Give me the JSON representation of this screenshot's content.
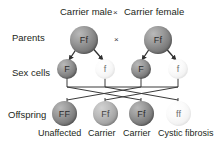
{
  "diagram": {
    "title_left": "Carrier male",
    "title_cross": "×",
    "title_right": "Carrier female",
    "parents_cross": "×",
    "rows": {
      "parents_label": "Parents",
      "sex_cells_label": "Sex cells",
      "offspring_label": "Offspring"
    },
    "parents": [
      {
        "genotype": "Ff",
        "shade": "dark"
      },
      {
        "genotype": "Ff",
        "shade": "dark"
      }
    ],
    "sex_cells": [
      {
        "allele": "F",
        "shade": "dark"
      },
      {
        "allele": "f",
        "shade": "light"
      },
      {
        "allele": "F",
        "shade": "dark"
      },
      {
        "allele": "f",
        "shade": "light"
      }
    ],
    "offspring": [
      {
        "genotype": "FF",
        "shade": "dark",
        "phenotype": "Unaffected"
      },
      {
        "genotype": "Ff",
        "shade": "mid",
        "phenotype": "Carrier"
      },
      {
        "genotype": "Ff",
        "shade": "dark",
        "phenotype": "Carrier"
      },
      {
        "genotype": "ff",
        "shade": "light",
        "phenotype": "Cystic fibrosis"
      }
    ],
    "colors": {
      "line": "#3a3a3a",
      "text": "#231f20",
      "background": "#ffffff"
    }
  }
}
